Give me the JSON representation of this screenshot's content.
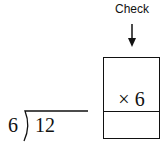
{
  "diagram": {
    "check_label": "Check",
    "box": {
      "top_text": "× 6",
      "bottom_text": ""
    },
    "division": {
      "divisor": "6",
      "dividend": "12"
    }
  }
}
